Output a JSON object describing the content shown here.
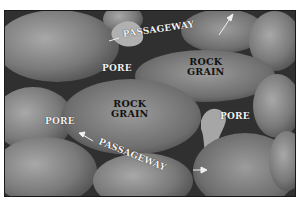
{
  "diagram": {
    "labels": {
      "rock_grain_top": "ROCK\nGRAIN",
      "rock_grain_center": "ROCK\nGRAIN",
      "pore_top": "PORE",
      "pore_left": "PORE",
      "pore_right": "PORE",
      "passageway_top": "PASSAGEWAY",
      "passageway_bottom": "PASSAGEWAY"
    },
    "colors": {
      "background": "#2e2e2e",
      "grain_light": "#9a9a9a",
      "grain_dark": "#4a4a4a",
      "label_light": "#f2f2f2",
      "label_dark": "#111111"
    }
  }
}
